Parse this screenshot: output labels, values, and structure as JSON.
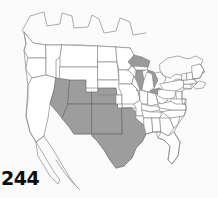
{
  "figure": {
    "number_label": "244",
    "caption": "",
    "background_color": "#fbfbfb"
  },
  "map": {
    "title": "",
    "projection_region": "North America - contiguous United States",
    "outline_color": "#8a8a8a",
    "unshaded_color": "#ffffff",
    "shaded_color": "#9d9d9d",
    "lake_color": "#9a9a9a",
    "legend": [],
    "shaded_regions": [
      {
        "name": "Nevada",
        "abbr": "NV",
        "shaded": true
      },
      {
        "name": "Utah",
        "abbr": "UT",
        "shaded": true
      },
      {
        "name": "Colorado",
        "abbr": "CO",
        "shaded": true
      },
      {
        "name": "Arizona",
        "abbr": "AZ",
        "shaded": true
      },
      {
        "name": "New Mexico",
        "abbr": "NM",
        "shaded": true
      },
      {
        "name": "Texas",
        "abbr": "TX",
        "shaded": true
      }
    ],
    "unshaded_regions": [
      {
        "name": "Washington",
        "abbr": "WA",
        "shaded": false
      },
      {
        "name": "Oregon",
        "abbr": "OR",
        "shaded": false
      },
      {
        "name": "California",
        "abbr": "CA",
        "shaded": false
      },
      {
        "name": "Idaho",
        "abbr": "ID",
        "shaded": false
      },
      {
        "name": "Montana",
        "abbr": "MT",
        "shaded": false
      },
      {
        "name": "Wyoming",
        "abbr": "WY",
        "shaded": false
      },
      {
        "name": "North Dakota",
        "abbr": "ND",
        "shaded": false
      },
      {
        "name": "South Dakota",
        "abbr": "SD",
        "shaded": false
      },
      {
        "name": "Nebraska",
        "abbr": "NE",
        "shaded": false
      },
      {
        "name": "Kansas",
        "abbr": "KS",
        "shaded": false
      },
      {
        "name": "Oklahoma",
        "abbr": "OK",
        "shaded": false
      },
      {
        "name": "Minnesota",
        "abbr": "MN",
        "shaded": false
      },
      {
        "name": "Iowa",
        "abbr": "IA",
        "shaded": false
      },
      {
        "name": "Missouri",
        "abbr": "MO",
        "shaded": false
      },
      {
        "name": "Arkansas",
        "abbr": "AR",
        "shaded": false
      },
      {
        "name": "Louisiana",
        "abbr": "LA",
        "shaded": false
      },
      {
        "name": "Wisconsin",
        "abbr": "WI",
        "shaded": false
      },
      {
        "name": "Illinois",
        "abbr": "IL",
        "shaded": false
      },
      {
        "name": "Michigan",
        "abbr": "MI",
        "shaded": false
      },
      {
        "name": "Indiana",
        "abbr": "IN",
        "shaded": false
      },
      {
        "name": "Ohio",
        "abbr": "OH",
        "shaded": false
      },
      {
        "name": "Kentucky",
        "abbr": "KY",
        "shaded": false
      },
      {
        "name": "Tennessee",
        "abbr": "TN",
        "shaded": false
      },
      {
        "name": "Mississippi",
        "abbr": "MS",
        "shaded": false
      },
      {
        "name": "Alabama",
        "abbr": "AL",
        "shaded": false
      },
      {
        "name": "Georgia",
        "abbr": "GA",
        "shaded": false
      },
      {
        "name": "Florida",
        "abbr": "FL",
        "shaded": false
      },
      {
        "name": "South Carolina",
        "abbr": "SC",
        "shaded": false
      },
      {
        "name": "North Carolina",
        "abbr": "NC",
        "shaded": false
      },
      {
        "name": "Virginia",
        "abbr": "VA",
        "shaded": false
      },
      {
        "name": "West Virginia",
        "abbr": "WV",
        "shaded": false
      },
      {
        "name": "Maryland",
        "abbr": "MD",
        "shaded": false
      },
      {
        "name": "Delaware",
        "abbr": "DE",
        "shaded": false
      },
      {
        "name": "Pennsylvania",
        "abbr": "PA",
        "shaded": false
      },
      {
        "name": "New Jersey",
        "abbr": "NJ",
        "shaded": false
      },
      {
        "name": "New York",
        "abbr": "NY",
        "shaded": false
      },
      {
        "name": "Connecticut",
        "abbr": "CT",
        "shaded": false
      },
      {
        "name": "Rhode Island",
        "abbr": "RI",
        "shaded": false
      },
      {
        "name": "Massachusetts",
        "abbr": "MA",
        "shaded": false
      },
      {
        "name": "Vermont",
        "abbr": "VT",
        "shaded": false
      },
      {
        "name": "New Hampshire",
        "abbr": "NH",
        "shaded": false
      },
      {
        "name": "Maine",
        "abbr": "ME",
        "shaded": false
      }
    ],
    "water_bodies": [
      {
        "name": "Lake Superior"
      },
      {
        "name": "Lake Michigan"
      },
      {
        "name": "Lake Huron"
      },
      {
        "name": "Lake Erie"
      },
      {
        "name": "Lake Ontario"
      }
    ]
  }
}
